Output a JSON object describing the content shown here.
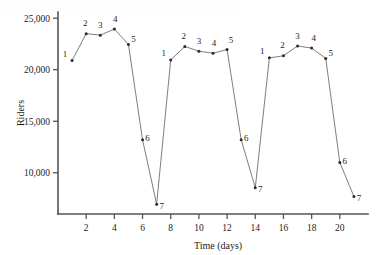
{
  "chart_data": {
    "type": "line",
    "title": "",
    "xlabel": "Time (days)",
    "ylabel": "Riders",
    "xlim": [
      0,
      22
    ],
    "ylim": [
      6000,
      25600
    ],
    "grid": false,
    "legend": null,
    "x": [
      1,
      2,
      3,
      4,
      5,
      6,
      7,
      8,
      9,
      10,
      11,
      12,
      13,
      14,
      15,
      16,
      17,
      18,
      19,
      20,
      21
    ],
    "values": [
      20900,
      23500,
      23350,
      23950,
      22450,
      13200,
      6950,
      20950,
      22250,
      21800,
      21600,
      21950,
      13200,
      8550,
      21150,
      21350,
      22300,
      22100,
      21100,
      11000,
      7700
    ],
    "point_labels": [
      "1",
      "2",
      "3",
      "4",
      "5",
      "6",
      "7",
      "1",
      "2",
      "3",
      "4",
      "5",
      "6",
      "7",
      "1",
      "2",
      "3",
      "4",
      "5",
      "6",
      "7"
    ],
    "xticks": [
      2,
      4,
      6,
      8,
      10,
      12,
      14,
      16,
      18,
      20
    ],
    "xtick_labels": [
      "2",
      "4",
      "6",
      "8",
      "10",
      "12",
      "14",
      "16",
      "18",
      "20"
    ],
    "yticks": [
      10000,
      15000,
      20000,
      25000
    ],
    "ytick_labels": [
      "10,000",
      "15,000",
      "20,000",
      "25,000"
    ],
    "series_name": "Riders per day",
    "line_color": "#6f6f6f",
    "marker_color": "#2b2b2b",
    "axis_color": "#545454",
    "background_color": "#ffffff"
  }
}
